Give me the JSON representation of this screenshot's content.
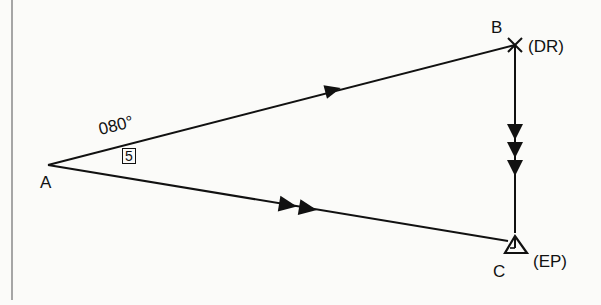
{
  "diagram": {
    "type": "navigation-triangle",
    "points": {
      "A": {
        "label": "A",
        "x": 48,
        "y": 165
      },
      "B": {
        "label": "B",
        "note": "(DR)",
        "marker": "cross",
        "x": 515,
        "y": 45
      },
      "C": {
        "label": "C",
        "note": "(EP)",
        "marker": "triangle",
        "x": 515,
        "y": 243
      }
    },
    "edges": [
      {
        "from": "A",
        "to": "B",
        "arrows": 1,
        "name": "track-AB"
      },
      {
        "from": "B",
        "to": "C",
        "arrows": 3,
        "name": "current-BC"
      },
      {
        "from": "A",
        "to": "C",
        "arrows": 2,
        "name": "course-AC"
      }
    ],
    "annotations": {
      "bearing": "080°",
      "boxed_number": "5"
    },
    "colors": {
      "ink": "#111111",
      "background": "#fbfbf9",
      "rule": "#8a8a8a"
    }
  }
}
